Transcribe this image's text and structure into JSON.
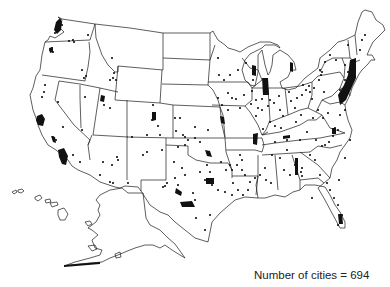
{
  "map": {
    "title": "",
    "region": "United States",
    "features": [
      "state boundaries",
      "Alaska inset",
      "Hawaii inset",
      "city points"
    ],
    "point_color": "#111111",
    "line_color": "#1a1a1a",
    "background": "#ffffff"
  },
  "caption": {
    "label": "Number of cities = 694",
    "count": 694
  },
  "cities": [
    [
      57,
      30
    ],
    [
      60,
      28
    ],
    [
      55,
      33
    ],
    [
      62,
      25
    ],
    [
      88,
      35
    ],
    [
      69,
      41
    ],
    [
      74,
      42
    ],
    [
      73,
      40
    ],
    [
      50,
      50
    ],
    [
      53,
      52
    ],
    [
      52,
      48
    ],
    [
      82,
      70
    ],
    [
      84,
      78
    ],
    [
      86,
      76
    ],
    [
      112,
      58
    ],
    [
      116,
      80
    ],
    [
      113,
      78
    ],
    [
      110,
      80
    ],
    [
      114,
      73
    ],
    [
      45,
      85
    ],
    [
      44,
      92
    ],
    [
      42,
      97
    ],
    [
      58,
      102
    ],
    [
      85,
      97
    ],
    [
      104,
      105
    ],
    [
      110,
      108
    ],
    [
      153,
      105
    ],
    [
      155,
      113
    ],
    [
      152,
      120
    ],
    [
      155,
      118
    ],
    [
      158,
      126
    ],
    [
      160,
      135
    ],
    [
      147,
      135
    ],
    [
      132,
      137
    ],
    [
      175,
      118
    ],
    [
      180,
      118
    ],
    [
      183,
      135
    ],
    [
      188,
      140
    ],
    [
      176,
      131
    ],
    [
      195,
      127
    ],
    [
      185,
      137
    ],
    [
      63,
      127
    ],
    [
      82,
      130
    ],
    [
      53,
      137
    ],
    [
      56,
      140
    ],
    [
      73,
      155
    ],
    [
      80,
      162
    ],
    [
      117,
      157
    ],
    [
      103,
      162
    ],
    [
      112,
      165
    ],
    [
      118,
      160
    ],
    [
      100,
      175
    ],
    [
      110,
      182
    ],
    [
      113,
      183
    ],
    [
      128,
      183
    ],
    [
      143,
      155
    ],
    [
      147,
      152
    ],
    [
      162,
      150
    ],
    [
      174,
      162
    ],
    [
      167,
      183
    ],
    [
      165,
      186
    ],
    [
      163,
      187
    ],
    [
      182,
      168
    ],
    [
      185,
      175
    ],
    [
      175,
      178
    ],
    [
      178,
      185
    ],
    [
      200,
      172
    ],
    [
      207,
      165
    ],
    [
      210,
      172
    ],
    [
      205,
      180
    ],
    [
      195,
      200
    ],
    [
      193,
      193
    ],
    [
      212,
      185
    ],
    [
      210,
      215
    ],
    [
      196,
      218
    ],
    [
      205,
      230
    ],
    [
      221,
      162
    ],
    [
      226,
      170
    ],
    [
      230,
      165
    ],
    [
      232,
      170
    ],
    [
      237,
      165
    ],
    [
      240,
      155
    ],
    [
      242,
      160
    ],
    [
      242,
      170
    ],
    [
      245,
      175
    ],
    [
      250,
      182
    ],
    [
      248,
      190
    ],
    [
      255,
      178
    ],
    [
      243,
      195
    ],
    [
      238,
      190
    ],
    [
      233,
      183
    ],
    [
      232,
      195
    ],
    [
      225,
      192
    ],
    [
      218,
      190
    ],
    [
      218,
      98
    ],
    [
      228,
      93
    ],
    [
      232,
      98
    ],
    [
      222,
      105
    ],
    [
      228,
      110
    ],
    [
      236,
      99
    ],
    [
      240,
      108
    ],
    [
      224,
      80
    ],
    [
      238,
      70
    ],
    [
      230,
      75
    ],
    [
      218,
      58
    ],
    [
      219,
      75
    ],
    [
      246,
      63
    ],
    [
      253,
      80
    ],
    [
      178,
      147
    ],
    [
      185,
      145
    ],
    [
      195,
      138
    ],
    [
      200,
      142
    ],
    [
      208,
      130
    ],
    [
      244,
      95
    ],
    [
      252,
      91
    ],
    [
      256,
      100
    ],
    [
      258,
      108
    ],
    [
      262,
      110
    ],
    [
      256,
      116
    ],
    [
      251,
      104
    ],
    [
      262,
      99
    ],
    [
      268,
      106
    ],
    [
      270,
      100
    ],
    [
      274,
      103
    ],
    [
      279,
      96
    ],
    [
      280,
      110
    ],
    [
      283,
      116
    ],
    [
      289,
      92
    ],
    [
      291,
      101
    ],
    [
      295,
      108
    ],
    [
      297,
      98
    ],
    [
      302,
      95
    ],
    [
      303,
      85
    ],
    [
      306,
      90
    ],
    [
      309,
      86
    ],
    [
      310,
      92
    ],
    [
      312,
      99
    ],
    [
      314,
      88
    ],
    [
      319,
      80
    ],
    [
      321,
      75
    ],
    [
      324,
      92
    ],
    [
      318,
      110
    ],
    [
      323,
      118
    ],
    [
      328,
      113
    ],
    [
      335,
      128
    ],
    [
      333,
      136
    ],
    [
      338,
      130
    ],
    [
      329,
      142
    ],
    [
      322,
      146
    ],
    [
      316,
      140
    ],
    [
      310,
      155
    ],
    [
      315,
      160
    ],
    [
      302,
      168
    ],
    [
      302,
      176
    ],
    [
      295,
      165
    ],
    [
      287,
      150
    ],
    [
      287,
      140
    ],
    [
      281,
      128
    ],
    [
      275,
      126
    ],
    [
      270,
      122
    ],
    [
      263,
      129
    ],
    [
      275,
      142
    ],
    [
      280,
      158
    ],
    [
      284,
      170
    ],
    [
      290,
      175
    ],
    [
      272,
      155
    ],
    [
      265,
      168
    ],
    [
      260,
      175
    ],
    [
      266,
      180
    ],
    [
      271,
      183
    ],
    [
      301,
      172
    ],
    [
      300,
      140
    ],
    [
      307,
      132
    ],
    [
      296,
      122
    ],
    [
      301,
      115
    ],
    [
      313,
      118
    ],
    [
      320,
      70
    ],
    [
      325,
      62
    ],
    [
      330,
      55
    ],
    [
      336,
      60
    ],
    [
      345,
      65
    ],
    [
      348,
      72
    ],
    [
      352,
      75
    ],
    [
      355,
      60
    ],
    [
      360,
      50
    ],
    [
      362,
      40
    ],
    [
      365,
      35
    ],
    [
      348,
      45
    ],
    [
      322,
      72
    ],
    [
      340,
      90
    ],
    [
      341,
      100
    ],
    [
      345,
      80
    ],
    [
      330,
      190
    ],
    [
      334,
      198
    ],
    [
      338,
      205
    ],
    [
      342,
      215
    ],
    [
      338,
      225
    ],
    [
      327,
      183
    ],
    [
      312,
      198
    ],
    [
      320,
      175
    ],
    [
      339,
      180
    ],
    [
      345,
      158
    ],
    [
      350,
      140
    ],
    [
      325,
      145
    ],
    [
      345,
      110
    ],
    [
      340,
      115
    ]
  ],
  "clusters": [
    "seattle-tacoma",
    "portland",
    "san-francisco-bay",
    "los-angeles",
    "san-diego",
    "denver",
    "salt-lake",
    "dallas-fort-worth",
    "houston",
    "austin-san-antonio",
    "oklahoma-city",
    "tulsa",
    "kansas-city",
    "chicago",
    "milwaukee",
    "detroit",
    "boston",
    "new-york",
    "philadelphia",
    "washington-baltimore",
    "atlanta",
    "charlotte",
    "nashville",
    "memphis",
    "minneapolis",
    "miami"
  ]
}
